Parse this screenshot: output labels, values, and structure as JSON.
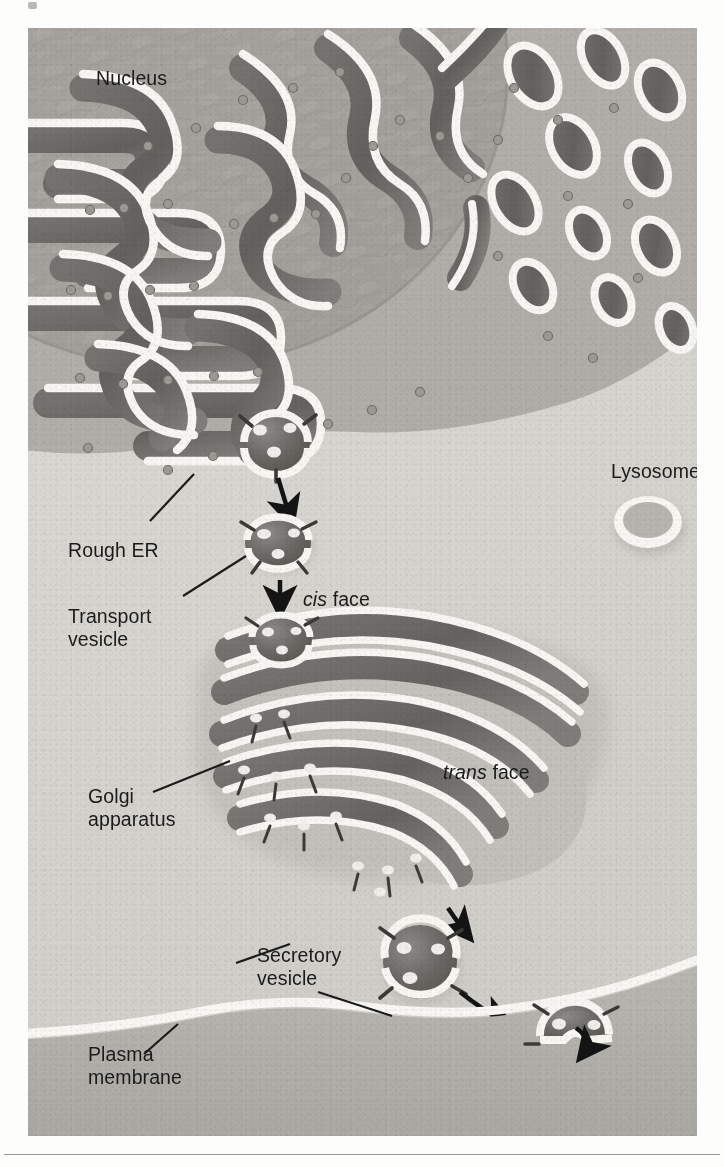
{
  "figure": {
    "title_alt": "Endomembrane system: rough ER to Golgi to plasma membrane",
    "background_color": "#e8e6e1",
    "cytoplasm_color": "#d8d6d0",
    "membrane_color": "#f7f6f2",
    "lumen_color": "#6e6d6c",
    "label_color": "#1b1b1b",
    "labels": [
      {
        "id": "nucleus",
        "text": "Nucleus",
        "line2": "",
        "x": 68,
        "y": 50,
        "italic_first": false
      },
      {
        "id": "rough-er",
        "text": "Rough ER",
        "line2": "",
        "x": 40,
        "y": 522,
        "italic_first": false
      },
      {
        "id": "transport",
        "text": "Transport",
        "line2": "vesicle",
        "x": 40,
        "y": 588,
        "italic_first": false
      },
      {
        "id": "cis-face",
        "text": "cis",
        "line2": " face",
        "x": 275,
        "y": 570,
        "italic_first": true
      },
      {
        "id": "trans-face",
        "text": "trans",
        "line2": " face",
        "x": 415,
        "y": 743,
        "italic_first": true
      },
      {
        "id": "golgi",
        "text": "Golgi",
        "line2": "apparatus",
        "x": 60,
        "y": 768,
        "italic_first": false
      },
      {
        "id": "lysosome",
        "text": "Lysosome",
        "line2": "",
        "x": 583,
        "y": 443,
        "italic_first": false
      },
      {
        "id": "secretory",
        "text": "Secretory",
        "line2": "vesicle",
        "x": 229,
        "y": 927,
        "italic_first": false
      },
      {
        "id": "plasma-membrane",
        "text": "Plasma",
        "line2": "membrane",
        "x": 60,
        "y": 1026,
        "italic_first": false
      }
    ],
    "organelles": {
      "nucleus_label": "Nucleus",
      "rough_er_label": "Rough ER",
      "transport_vesicle_label": "Transport vesicle",
      "golgi_label": "Golgi apparatus",
      "cis_face_label": "cis face",
      "trans_face_label": "trans face",
      "lysosome_label": "Lysosome",
      "secretory_vesicle_label": "Secretory vesicle",
      "plasma_membrane_label": "Plasma membrane"
    },
    "pathway_steps": [
      "Rough ER buds a transport vesicle",
      "Transport vesicle travels to the cis face of the Golgi apparatus",
      "Material moves through the Golgi stack toward the trans face",
      "A secretory vesicle buds from the trans face",
      "The secretory vesicle fuses with the plasma membrane and releases its contents"
    ]
  }
}
